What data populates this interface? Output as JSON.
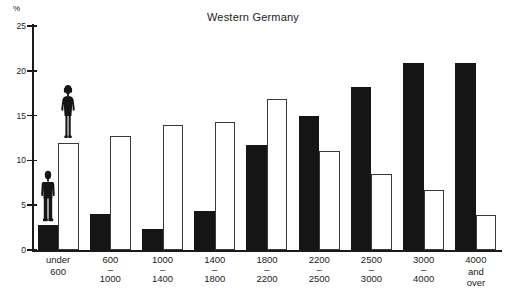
{
  "chart_data": {
    "type": "bar",
    "title": "Western Germany",
    "xlabel": "",
    "ylabel": "%",
    "ylim": [
      0,
      25
    ],
    "yticks": [
      0,
      5,
      10,
      15,
      20,
      25
    ],
    "grid": false,
    "legend": "none",
    "categories": [
      "under 600",
      "600 - 1000",
      "1000 - 1400",
      "1400 - 1800",
      "1800 - 2200",
      "2200 - 2500",
      "2500 - 3000",
      "3000 - 4000",
      "4000 and over"
    ],
    "series": [
      {
        "name": "Men",
        "color": "#151515",
        "values": [
          2.8,
          4.0,
          2.3,
          4.3,
          11.7,
          15.0,
          18.2,
          20.9,
          20.9
        ]
      },
      {
        "name": "Women",
        "color": "#ffffff",
        "values": [
          11.9,
          12.7,
          13.9,
          14.3,
          16.9,
          11.0,
          8.5,
          6.7,
          3.9
        ]
      }
    ],
    "annotations": [
      {
        "name": "male-figure-pictogram",
        "on_series": "Men",
        "on_category_index": 0
      },
      {
        "name": "female-figure-pictogram",
        "on_series": "Women",
        "on_category_index": 0
      }
    ]
  },
  "axis": {
    "unit_label": "%",
    "tick_labels": [
      "0",
      "5",
      "10",
      "15",
      "20",
      "25"
    ]
  },
  "xaxis_labels": [
    {
      "line1": "under",
      "dash": "",
      "line2": "600",
      "line3": ""
    },
    {
      "line1": "600",
      "dash": "–",
      "line2": "1000",
      "line3": ""
    },
    {
      "line1": "1000",
      "dash": "–",
      "line2": "1400",
      "line3": ""
    },
    {
      "line1": "1400",
      "dash": "–",
      "line2": "1800",
      "line3": ""
    },
    {
      "line1": "1800",
      "dash": "–",
      "line2": "2200",
      "line3": ""
    },
    {
      "line1": "2200",
      "dash": "–",
      "line2": "2500",
      "line3": ""
    },
    {
      "line1": "2500",
      "dash": "–",
      "line2": "3000",
      "line3": ""
    },
    {
      "line1": "3000",
      "dash": "–",
      "line2": "4000",
      "line3": ""
    },
    {
      "line1": "4000",
      "dash": "",
      "line2": "and",
      "line3": "over"
    }
  ]
}
